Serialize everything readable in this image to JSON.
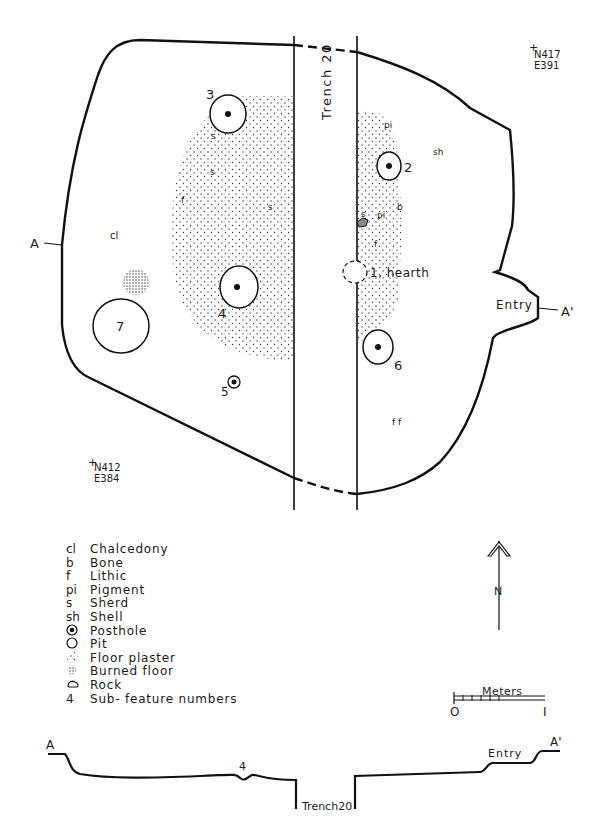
{
  "plan": {
    "corner_ne": {
      "north": "N417",
      "east": "E391"
    },
    "corner_sw": {
      "north": "N412",
      "east": "E384"
    },
    "section_start": "A",
    "section_end": "A'",
    "entry_label": "Entry",
    "trench_label": "Trench  20",
    "artifacts": {
      "cl": "cl",
      "s1": "s",
      "s2": "s",
      "s3": "s",
      "f1": "f",
      "pi1": "pi",
      "sh": "sh",
      "s4": "s",
      "pi2": "pi",
      "b": "b",
      "f2": "f",
      "ff": "f f"
    },
    "features": [
      {
        "id": "3",
        "type": "posthole"
      },
      {
        "id": "2",
        "type": "posthole"
      },
      {
        "id": "4",
        "type": "posthole"
      },
      {
        "id": "6",
        "type": "posthole"
      },
      {
        "id": "5",
        "type": "posthole"
      },
      {
        "id": "7",
        "type": "pit"
      },
      {
        "id": "1, hearth",
        "type": "pit"
      }
    ]
  },
  "legend": {
    "items": [
      {
        "symbol": "cl",
        "label": "Chalcedony"
      },
      {
        "symbol": "b",
        "label": "Bone"
      },
      {
        "symbol": "f",
        "label": "Lithic"
      },
      {
        "symbol": "pi",
        "label": "Pigment"
      },
      {
        "symbol": "s",
        "label": "Sherd"
      },
      {
        "symbol": "sh",
        "label": "Shell"
      },
      {
        "symbol": "posthole-icon",
        "label": "Posthole"
      },
      {
        "symbol": "pit-icon",
        "label": "Pit"
      },
      {
        "symbol": "floor-plaster-icon",
        "label": "Floor plaster"
      },
      {
        "symbol": "burned-floor-icon",
        "label": "Burned floor"
      },
      {
        "symbol": "rock-icon",
        "label": "Rock"
      },
      {
        "symbol": "4",
        "label": "Sub- feature numbers"
      }
    ]
  },
  "north_arrow": {
    "label": "N"
  },
  "scale_bar": {
    "title": "Meters",
    "start": "O",
    "end": "I"
  },
  "profile": {
    "start": "A",
    "end": "A'",
    "feature_label": "4",
    "entry_label": "Entry",
    "trench_label": "Trench20"
  }
}
